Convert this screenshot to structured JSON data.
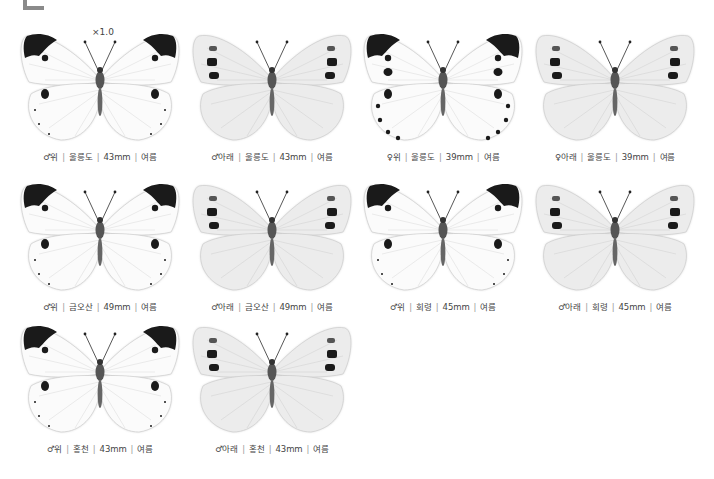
{
  "scale_label": "×1.0",
  "separator": "|",
  "specimens": [
    {
      "sex": "♂",
      "side": "위",
      "location": "울릉도",
      "size": "43mm",
      "season": "여름",
      "view": "upper",
      "x": 15,
      "y": 28
    },
    {
      "sex": "♂",
      "side": "아래",
      "location": "울릉도",
      "size": "43mm",
      "season": "여름",
      "view": "under",
      "x": 187,
      "y": 28
    },
    {
      "sex": "♀",
      "side": "위",
      "location": "울릉도",
      "size": "39mm",
      "season": "여름",
      "view": "upper-female",
      "x": 358,
      "y": 28
    },
    {
      "sex": "♀",
      "side": "아래",
      "location": "울릉도",
      "size": "39mm",
      "season": "여름",
      "view": "under",
      "x": 530,
      "y": 28
    },
    {
      "sex": "♂",
      "side": "위",
      "location": "금오산",
      "size": "49mm",
      "season": "여름",
      "view": "upper",
      "x": 15,
      "y": 178
    },
    {
      "sex": "♂",
      "side": "아래",
      "location": "금오산",
      "size": "49mm",
      "season": "여름",
      "view": "under",
      "x": 187,
      "y": 178
    },
    {
      "sex": "♂",
      "side": "위",
      "location": "회령",
      "size": "45mm",
      "season": "여름",
      "view": "upper",
      "x": 358,
      "y": 178
    },
    {
      "sex": "♂",
      "side": "아래",
      "location": "회령",
      "size": "45mm",
      "season": "여름",
      "view": "under",
      "x": 530,
      "y": 178
    },
    {
      "sex": "♂",
      "side": "위",
      "location": "홍천",
      "size": "43mm",
      "season": "여름",
      "view": "upper",
      "x": 15,
      "y": 320
    },
    {
      "sex": "♂",
      "side": "아래",
      "location": "홍천",
      "size": "43mm",
      "season": "여름",
      "view": "under",
      "x": 187,
      "y": 320
    }
  ]
}
